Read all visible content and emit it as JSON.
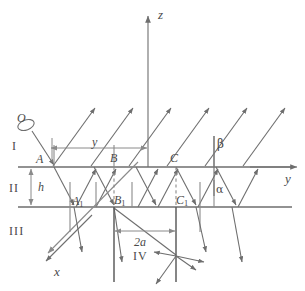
{
  "figure": {
    "stroke_color": "#6e6e6e",
    "dashed_color": "#8a8a8a",
    "text_color": "#4a4a4a",
    "background": "#ffffff",
    "width": 305,
    "height": 291
  },
  "axes": {
    "z": {
      "label": "z",
      "x": 160,
      "y": 12,
      "arrow_tip": [
        148,
        14
      ],
      "origin": [
        148,
        167
      ]
    },
    "y": {
      "label": "y",
      "x": 286,
      "y": 178,
      "arrow_tip": [
        298,
        167
      ],
      "origin": [
        18,
        167
      ]
    },
    "x": {
      "label": "x",
      "x": 56,
      "y": 274,
      "arrow_tip": [
        44,
        262
      ],
      "origin": [
        148,
        167
      ]
    }
  },
  "regions": [
    {
      "name": "region-I",
      "label": "I",
      "x": 12,
      "y": 142
    },
    {
      "name": "region-II",
      "label": "II",
      "x": 10,
      "y": 185
    },
    {
      "name": "region-III",
      "label": "III",
      "x": 10,
      "y": 228
    },
    {
      "name": "region-IV",
      "label": "IV",
      "x": 133,
      "y": 252
    }
  ],
  "points": [
    {
      "name": "source-O",
      "label": "O",
      "x": 19,
      "y": 117,
      "kind": "source-oval"
    },
    {
      "name": "point-A",
      "label": "A",
      "x": 36,
      "y": 154,
      "kind": "upper-interface"
    },
    {
      "name": "point-B",
      "label": "B",
      "x": 110,
      "y": 154,
      "kind": "upper-interface"
    },
    {
      "name": "point-C",
      "label": "C",
      "x": 172,
      "y": 154,
      "kind": "upper-interface"
    },
    {
      "name": "point-A1",
      "label": "A",
      "sub": "1",
      "x": 73,
      "y": 196,
      "kind": "lower-interface"
    },
    {
      "name": "point-B1",
      "label": "B",
      "sub": "1",
      "x": 114,
      "y": 196,
      "kind": "lower-interface"
    },
    {
      "name": "point-C1",
      "label": "C",
      "sub": "1",
      "x": 176,
      "y": 196,
      "kind": "lower-interface"
    }
  ],
  "angles": [
    {
      "name": "angle-beta",
      "label": "β",
      "x": 217,
      "y": 138,
      "description": "refraction angle above upper interface"
    },
    {
      "name": "angle-alpha",
      "label": "α",
      "x": 216,
      "y": 187,
      "description": "incidence angle inside layer II"
    }
  ],
  "dimensions": [
    {
      "name": "dim-y",
      "label": "y",
      "label_x": 92,
      "label_y": 138,
      "from": [
        52,
        148
      ],
      "to": [
        146,
        148
      ],
      "orientation": "horizontal"
    },
    {
      "name": "dim-h",
      "label": "h",
      "label_x": 38,
      "label_y": 186,
      "from": [
        31,
        168
      ],
      "to": [
        31,
        206
      ],
      "orientation": "vertical"
    },
    {
      "name": "dim-2a",
      "label": "2a",
      "label_x": 134,
      "label_y": 238,
      "from": [
        114,
        231
      ],
      "to": [
        176,
        231
      ],
      "orientation": "horizontal"
    }
  ],
  "interfaces": [
    {
      "name": "upper-interface",
      "y": 167,
      "x1": 18,
      "x2": 298
    },
    {
      "name": "lower-interface",
      "y": 207,
      "x1": 18,
      "x2": 292
    }
  ],
  "scatter_point": {
    "name": "scatter-center",
    "x": 176,
    "y": 256,
    "ray_count": 4
  },
  "escaping_rays": {
    "name": "escaping-rays",
    "count": 6,
    "direction": "up-right",
    "start_x": [
      52,
      90,
      128,
      166,
      204,
      242
    ],
    "start_y": 167,
    "length": 62
  }
}
